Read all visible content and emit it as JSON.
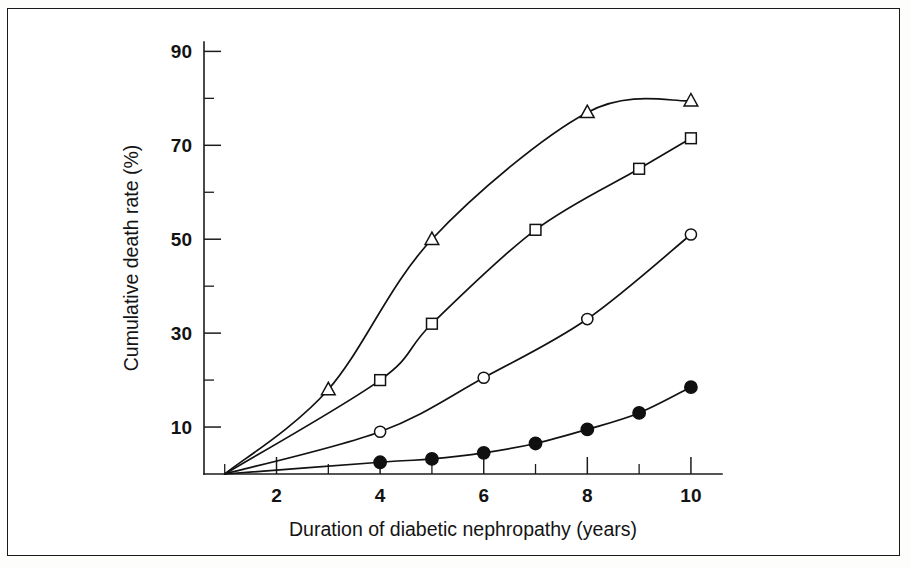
{
  "figure": {
    "border_color": "#1a1a1a",
    "background_color": "#ffffff",
    "line_color": "#121212"
  },
  "axes": {
    "y_title": "Cumulative death rate (%)",
    "x_title": "Duration of diabetic nephropathy (years)",
    "y_major_ticks": [
      10,
      30,
      50,
      70,
      90
    ],
    "y_minor_ticks": [
      20,
      40,
      60,
      80
    ],
    "y_tick_labels": [
      "10",
      "30",
      "50",
      "70",
      "90"
    ],
    "x_major_ticks": [
      2,
      4,
      6,
      8,
      10
    ],
    "x_minor_ticks": [
      1,
      3,
      5,
      7,
      9
    ],
    "x_tick_labels": [
      "2",
      "4",
      "6",
      "8",
      "10"
    ]
  },
  "chart_data": {
    "type": "line",
    "title": "",
    "subtitle": "",
    "xlabel": "Duration of diabetic nephropathy (years)",
    "ylabel": "Cumulative death rate (%)",
    "xlim": [
      0.6,
      10.6
    ],
    "ylim": [
      0,
      92
    ],
    "grid": false,
    "legend": "none",
    "series": [
      {
        "name": "open-triangle",
        "marker": "triangle-open",
        "x": [
          1,
          3,
          5,
          8,
          10
        ],
        "y": [
          0,
          18,
          50,
          77,
          79.5
        ],
        "values": [
          0,
          18,
          50,
          77,
          79.5
        ]
      },
      {
        "name": "open-square",
        "marker": "square-open",
        "x": [
          1,
          4,
          5,
          7,
          9,
          10
        ],
        "y": [
          0,
          20,
          32,
          52,
          65,
          71.5
        ],
        "values": [
          0,
          20,
          32,
          52,
          65,
          71.5
        ]
      },
      {
        "name": "open-circle",
        "marker": "circle-open",
        "x": [
          1,
          4,
          6,
          8,
          10
        ],
        "y": [
          0,
          9,
          20.5,
          33,
          51
        ],
        "values": [
          0,
          9,
          20.5,
          33,
          51
        ]
      },
      {
        "name": "filled-circle",
        "marker": "circle-filled",
        "x": [
          1,
          4,
          5,
          6,
          7,
          8,
          9,
          10
        ],
        "y": [
          0,
          2.5,
          3.2,
          4.5,
          6.5,
          9.5,
          13,
          18.5
        ],
        "values": [
          0,
          2.5,
          3.2,
          4.5,
          6.5,
          9.5,
          13,
          18.5
        ]
      }
    ]
  }
}
